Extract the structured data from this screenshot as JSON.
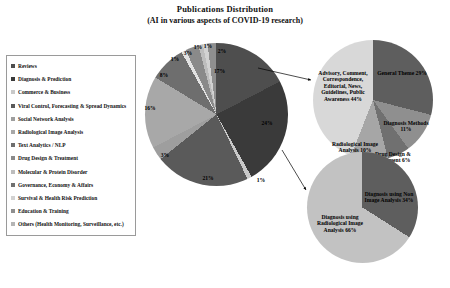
{
  "title": {
    "line1": "Publications Distribution",
    "line2": "(AI in various aspects of COVID-19 research)"
  },
  "legend": {
    "items": [
      {
        "label": "Reviews",
        "color": "#4e4e4e"
      },
      {
        "label": "Diagnosis & Prediction",
        "color": "#3a3a3a"
      },
      {
        "label": "Commerce & Business",
        "color": "#c9c9c9"
      },
      {
        "label": "Viral Control, Forecasting & Spread Dynamics",
        "color": "#5a5a5a"
      },
      {
        "label": "Social Network Analysis",
        "color": "#9e9e9e"
      },
      {
        "label": "Radiological Image Analysis",
        "color": "#a8a8a8"
      },
      {
        "label": "Text Analytics / NLP",
        "color": "#6e6e6e"
      },
      {
        "label": "Drug Design & Treatment",
        "color": "#8a8a8a"
      },
      {
        "label": "Molecular & Protein Disorder",
        "color": "#bdbdbd"
      },
      {
        "label": "Governance, Economy & Affairs",
        "color": "#707070"
      },
      {
        "label": "Survival & Health Risk Prediction",
        "color": "#d2d2d2"
      },
      {
        "label": "Education & Training",
        "color": "#8f8f8f"
      },
      {
        "label": "Others (Health Monitoring, Surveillance, etc.)",
        "color": "#b5b5b5"
      }
    ]
  },
  "chart_data": [
    {
      "type": "pie",
      "name": "main-distribution",
      "title": "Publications Distribution",
      "legend_position": "left",
      "categories": [
        "Reviews",
        "Diagnosis & Prediction",
        "Commerce & Business",
        "Viral Control, Forecasting & Spread Dynamics",
        "Social Network Analysis",
        "Radiological Image Analysis",
        "Text Analytics / NLP",
        "Drug Design & Treatment",
        "Molecular & Protein Disorder",
        "Governance, Economy & Affairs",
        "Survival & Health Risk Prediction",
        "Education & Training",
        "Others (Health Monitoring, Surveillance, etc.)"
      ],
      "values": [
        17,
        24,
        1,
        21,
        3,
        16,
        8,
        1,
        3,
        1,
        1,
        2,
        2
      ],
      "labels": [
        "17%",
        "24%",
        "1%",
        "21%",
        "3%",
        "16%",
        "8%",
        "1%",
        "3%",
        "1%",
        "1%",
        "2%"
      ],
      "unit": "%"
    },
    {
      "type": "pie",
      "name": "reviews-breakdown",
      "categories": [
        "Advisory, Comment, Correspondence, Editorial, News, Guidelines, Public Awareness",
        "General Theme",
        "Diagnosis Methods",
        "Drug Design & Treatment",
        "Radiological Image Analysis"
      ],
      "values": [
        44,
        29,
        11,
        6,
        10
      ],
      "unit": "%"
    },
    {
      "type": "pie",
      "name": "diagnosis-breakdown",
      "categories": [
        "Diagnosis using Radiological Image Analysis",
        "Diagnosis using Non Image Analysis"
      ],
      "values": [
        66,
        34
      ],
      "unit": "%"
    }
  ],
  "main_pie": {
    "labels": [
      {
        "text": "17%",
        "x": 74.5,
        "y": 28
      },
      {
        "text": "24%",
        "x": 122,
        "y": 80
      },
      {
        "text": "1%",
        "x": 116,
        "y": 137
      },
      {
        "text": "21%",
        "x": 63,
        "y": 135
      },
      {
        "text": "3%",
        "x": 20,
        "y": 112
      },
      {
        "text": "16%",
        "x": 5,
        "y": 65
      },
      {
        "text": "8%",
        "x": 19,
        "y": 32
      },
      {
        "text": "1%",
        "x": 30,
        "y": 16
      },
      {
        "text": "3%",
        "x": 43,
        "y": 10
      },
      {
        "text": "1%",
        "x": 53,
        "y": 4
      },
      {
        "text": "1%",
        "x": 63,
        "y": 3
      },
      {
        "text": "2%",
        "x": 77,
        "y": 8
      }
    ]
  },
  "top_pie": {
    "labels": [
      {
        "text": "Advisory, Comment, Correspondence, Editorial, News, Guidelines, Public Awareness 44%",
        "x": 30,
        "y": 46
      },
      {
        "text": "General Theme 29%",
        "x": 89,
        "y": 33
      },
      {
        "text": "Diagnosis Methods 11%",
        "x": 93,
        "y": 86
      },
      {
        "text": "Drug Design & Treatment 6%",
        "x": 80,
        "y": 117
      },
      {
        "text": "Radiological Image Analysis 10%",
        "x": 42,
        "y": 107
      }
    ]
  },
  "bottom_pie": {
    "labels": [
      {
        "text": "Diagnosis using Non Image Analysis 34%",
        "x": 82,
        "y": 45
      },
      {
        "text": "Diagnosis using Radiological Image Analysis 66%",
        "x": 33,
        "y": 72
      }
    ]
  },
  "colors": {
    "background": "#ffffff",
    "text": "#111111",
    "border": "#9a9a9a"
  }
}
